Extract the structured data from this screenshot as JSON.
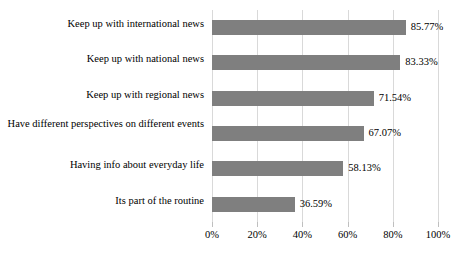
{
  "chart_data": {
    "type": "bar",
    "orientation": "horizontal",
    "title": "",
    "subtitle": "",
    "xlabel": "",
    "ylabel": "",
    "xlim": [
      0,
      100
    ],
    "grid": true,
    "legend": false,
    "legend_position": "none",
    "bar_color": "#7f7f7f",
    "gridline_color": "#d9d9d9",
    "text_color": "#000000",
    "background_color": "#ffffff",
    "categories": [
      "Keep up with international news",
      "Keep up with national news",
      "Keep up with regional news",
      "Have different perspectives on different events",
      "Having info about everyday life",
      "Its part of the routine"
    ],
    "values": [
      85.77,
      83.33,
      71.54,
      67.07,
      58.13,
      36.59
    ],
    "value_labels": [
      "85.77%",
      "83.33%",
      "71.54%",
      "67.07%",
      "58.13%",
      "36.59%"
    ],
    "x_ticks": [
      0,
      20,
      40,
      60,
      80,
      100
    ],
    "x_tick_labels": [
      "0%",
      "20%",
      "40%",
      "60%",
      "80%",
      "100%"
    ]
  }
}
